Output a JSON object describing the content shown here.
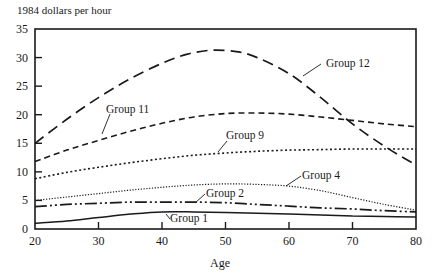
{
  "chart_data": {
    "type": "line",
    "title": "",
    "ylabel": "1984 dollars per hour",
    "xlabel": "Age",
    "xlim": [
      20,
      80
    ],
    "ylim": [
      0,
      35
    ],
    "x_ticks": [
      20,
      30,
      40,
      50,
      60,
      70,
      80
    ],
    "y_ticks": [
      0,
      5,
      10,
      15,
      20,
      25,
      30,
      35
    ],
    "grid": false,
    "legend": "inline labels with leader lines",
    "x": [
      20,
      30,
      40,
      48,
      55,
      60,
      65,
      70,
      75,
      80
    ],
    "series": [
      {
        "name": "Group 12",
        "style": "long-dash",
        "points": [
          [
            20,
            15.0
          ],
          [
            25,
            19.2
          ],
          [
            30,
            23.0
          ],
          [
            35,
            26.3
          ],
          [
            40,
            29.0
          ],
          [
            44,
            30.6
          ],
          [
            48,
            31.3
          ],
          [
            52,
            31.0
          ],
          [
            55,
            30.0
          ],
          [
            60,
            27.2
          ],
          [
            65,
            23.0
          ],
          [
            70,
            18.4
          ],
          [
            75,
            14.5
          ],
          [
            80,
            11.2
          ]
        ],
        "label": {
          "text": "Group 12",
          "x": 326,
          "y": 67,
          "leader": [
            [
              321,
              64
            ],
            [
              303,
              76
            ]
          ]
        }
      },
      {
        "name": "Group 11",
        "style": "short-dash",
        "points": [
          [
            20,
            11.8
          ],
          [
            25,
            13.8
          ],
          [
            30,
            15.5
          ],
          [
            35,
            17.1
          ],
          [
            40,
            18.5
          ],
          [
            45,
            19.6
          ],
          [
            50,
            20.2
          ],
          [
            55,
            20.3
          ],
          [
            60,
            20.1
          ],
          [
            65,
            19.6
          ],
          [
            70,
            19.0
          ],
          [
            75,
            18.4
          ],
          [
            80,
            17.9
          ]
        ],
        "label": {
          "text": "Group 11",
          "x": 106,
          "y": 113,
          "leader": [
            [
              110,
              114
            ],
            [
              102,
              134
            ]
          ]
        }
      },
      {
        "name": "Group 9",
        "style": "dotted",
        "points": [
          [
            20,
            8.8
          ],
          [
            25,
            9.9
          ],
          [
            30,
            10.8
          ],
          [
            35,
            11.6
          ],
          [
            40,
            12.3
          ],
          [
            45,
            12.9
          ],
          [
            50,
            13.3
          ],
          [
            55,
            13.6
          ],
          [
            60,
            13.8
          ],
          [
            65,
            13.9
          ],
          [
            70,
            14.0
          ],
          [
            75,
            14.0
          ],
          [
            80,
            14.0
          ]
        ],
        "label": {
          "text": "Group 9",
          "x": 226,
          "y": 139,
          "leader": [
            [
              227,
              141
            ],
            [
              218,
              152
            ]
          ]
        }
      },
      {
        "name": "Group 4",
        "style": "fine-dotted",
        "points": [
          [
            20,
            5.0
          ],
          [
            25,
            5.6
          ],
          [
            30,
            6.2
          ],
          [
            35,
            6.8
          ],
          [
            40,
            7.3
          ],
          [
            45,
            7.7
          ],
          [
            50,
            7.9
          ],
          [
            55,
            7.8
          ],
          [
            60,
            7.5
          ],
          [
            65,
            6.7
          ],
          [
            70,
            5.5
          ],
          [
            75,
            4.3
          ],
          [
            80,
            3.3
          ]
        ],
        "label": {
          "text": "Group 4",
          "x": 302,
          "y": 179,
          "leader": [
            [
              301,
              176
            ],
            [
              286,
              186
            ]
          ]
        }
      },
      {
        "name": "Group 2",
        "style": "dash-dot",
        "points": [
          [
            20,
            3.9
          ],
          [
            25,
            4.3
          ],
          [
            30,
            4.5
          ],
          [
            35,
            4.7
          ],
          [
            40,
            4.7
          ],
          [
            45,
            4.7
          ],
          [
            50,
            4.6
          ],
          [
            55,
            4.3
          ],
          [
            60,
            4.0
          ],
          [
            65,
            3.7
          ],
          [
            70,
            3.5
          ],
          [
            75,
            3.2
          ],
          [
            80,
            3.0
          ]
        ],
        "label": {
          "text": "Group 2",
          "x": 206,
          "y": 197,
          "leader": [
            [
              205,
              194
            ],
            [
              195,
              203
            ]
          ]
        }
      },
      {
        "name": "Group 1",
        "style": "solid",
        "points": [
          [
            20,
            1.0
          ],
          [
            25,
            1.4
          ],
          [
            30,
            2.0
          ],
          [
            35,
            2.6
          ],
          [
            40,
            3.0
          ],
          [
            45,
            3.0
          ],
          [
            50,
            2.9
          ],
          [
            55,
            2.75
          ],
          [
            60,
            2.6
          ],
          [
            65,
            2.45
          ],
          [
            70,
            2.3
          ],
          [
            75,
            2.2
          ],
          [
            80,
            2.1
          ]
        ],
        "label": {
          "text": "Group 1",
          "x": 170,
          "y": 222,
          "leader": [
            [
              166,
              214
            ],
            [
              170,
              219
            ]
          ]
        }
      }
    ]
  },
  "labels": {
    "unit": "1984 dollars per hour",
    "x_axis_title": "Age"
  }
}
